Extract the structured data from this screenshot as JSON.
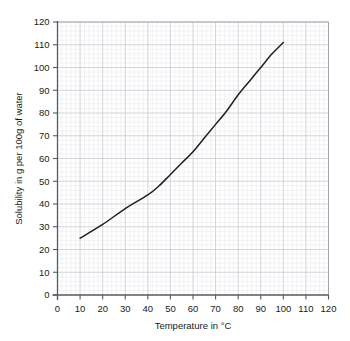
{
  "chart_data": {
    "type": "line",
    "title": "",
    "xlabel": "Temperature in °C",
    "ylabel": "Solubility in g per 100g of water",
    "xlim": [
      0,
      120
    ],
    "ylim": [
      0,
      120
    ],
    "xticks": [
      0,
      10,
      20,
      30,
      40,
      50,
      60,
      70,
      80,
      90,
      100,
      110,
      120
    ],
    "yticks": [
      0,
      10,
      20,
      30,
      40,
      50,
      60,
      70,
      80,
      90,
      100,
      110,
      120
    ],
    "xtick_labels": [
      "0",
      "10",
      "20",
      "30",
      "40",
      "50",
      "60",
      "70",
      "80",
      "90",
      "100",
      "110",
      "120"
    ],
    "ytick_labels": [
      "0",
      "10",
      "20",
      "30",
      "40",
      "50",
      "60",
      "70",
      "80",
      "90",
      "100",
      "110",
      "120"
    ],
    "grid": true,
    "grid_minor_step": 2,
    "grid_major_step": 10,
    "legend": null,
    "legend_position": "none",
    "series": [
      {
        "name": "Solubility curve",
        "color": "#231f20",
        "x": [
          10,
          20,
          30,
          40,
          45,
          50,
          55,
          60,
          65,
          70,
          75,
          80,
          85,
          90,
          95,
          100
        ],
        "values": [
          25,
          31,
          38,
          44,
          48,
          53,
          58,
          63,
          69,
          75,
          81,
          88,
          94,
          100,
          106,
          111
        ]
      }
    ]
  },
  "axes": {
    "y_axis_title": "Solubility in g per 100g of water",
    "x_axis_title": "Temperature in °C"
  },
  "colors": {
    "curve": "#231f20",
    "axis": "#555a60",
    "grid_major": "#c9c9d2",
    "grid_minor": "#e9e9ef",
    "text": "#1a1a1a",
    "background": "#ffffff"
  }
}
